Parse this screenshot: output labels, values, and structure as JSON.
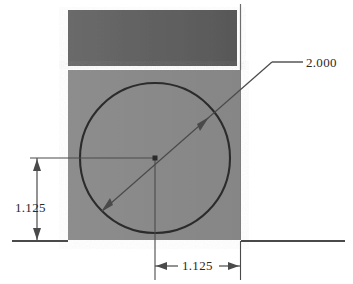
{
  "drawing": {
    "type": "cad-orthographic-view",
    "title": "Block with through hole - front view",
    "background_color": "#ffffff",
    "line_color": "#3a3a3a",
    "geometry": {
      "block": {
        "name": "rectangular-block",
        "fill_color": "#8a8a8a",
        "x": 68,
        "y": 70,
        "width": 172,
        "height": 170
      },
      "top_band": {
        "name": "upper-face-band",
        "fill_color": "#616161",
        "x": 68,
        "y": 10,
        "width": 169,
        "height": 56
      },
      "circle": {
        "name": "through-hole",
        "center_x": 155,
        "center_y": 158,
        "radius": 75,
        "stroke_color": "#2b2b2b"
      }
    },
    "dimensions": [
      {
        "id": "diameter",
        "name": "diameter-dimension",
        "value": "2.000",
        "kind": "diameter",
        "leader_elbow_x": 272,
        "leader_elbow_y": 62,
        "leader_end_x": 303,
        "leader_end_y": 62
      },
      {
        "id": "vertical",
        "name": "vertical-dimension",
        "value": "1.125",
        "kind": "linear-vertical",
        "line_x": 37,
        "top_y": 158,
        "bottom_y": 241
      },
      {
        "id": "horizontal",
        "name": "horizontal-dimension",
        "value": "1.125",
        "kind": "linear-horizontal",
        "line_y": 266,
        "left_x": 155,
        "right_x": 240
      }
    ],
    "annotations": {
      "top_partial_mark": ""
    }
  }
}
